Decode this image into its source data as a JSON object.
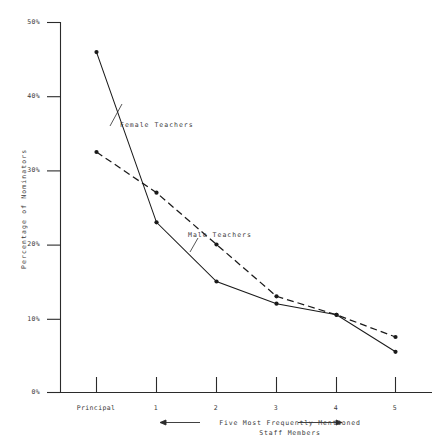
{
  "chart_data": {
    "type": "line",
    "title": "",
    "xlabel": "Five Most Frequently Mentioned Staff Members",
    "xlabel_line1": "Five Most Frequently Mentioned",
    "xlabel_line2": "Staff Members",
    "ylabel": "Percentage of Nominators",
    "categories": [
      "Principal",
      "1",
      "2",
      "3",
      "4",
      "5"
    ],
    "ylim": [
      0,
      50
    ],
    "yticks": [
      0,
      10,
      20,
      30,
      40,
      50
    ],
    "ytick_labels": [
      "0%",
      "10%",
      "20%",
      "30%",
      "40%",
      "50%"
    ],
    "grid": false,
    "legend_position": "inline-annotation",
    "series": [
      {
        "name": "Female Teachers",
        "style": "solid",
        "color": "#1a1a1a",
        "values": [
          46.0,
          23.0,
          15.0,
          12.0,
          10.5,
          5.5
        ]
      },
      {
        "name": "Male Teachers",
        "style": "dashed",
        "color": "#1a1a1a",
        "values": [
          32.5,
          27.0,
          20.0,
          13.0,
          10.5,
          7.5
        ]
      }
    ],
    "annotations": [
      {
        "text": "Female Teachers",
        "series": "Female Teachers"
      },
      {
        "text": "Male Teachers",
        "series": "Male Teachers"
      }
    ]
  },
  "axis": {
    "y_title": "Percentage of Nominators",
    "y_tick_labels": [
      "50%",
      "40%",
      "30%",
      "20%",
      "10%",
      "0%"
    ],
    "x_tick_labels": [
      "Principal",
      "1",
      "2",
      "3",
      "4",
      "5"
    ],
    "x_caption_line1": "Five Most Frequently Mentioned",
    "x_caption_line2": "Staff Members",
    "arrow_left": "left-arrow-icon",
    "arrow_right": "right-arrow-icon"
  },
  "series_labels": {
    "female": "Female Teachers",
    "male": "Male Teachers"
  }
}
